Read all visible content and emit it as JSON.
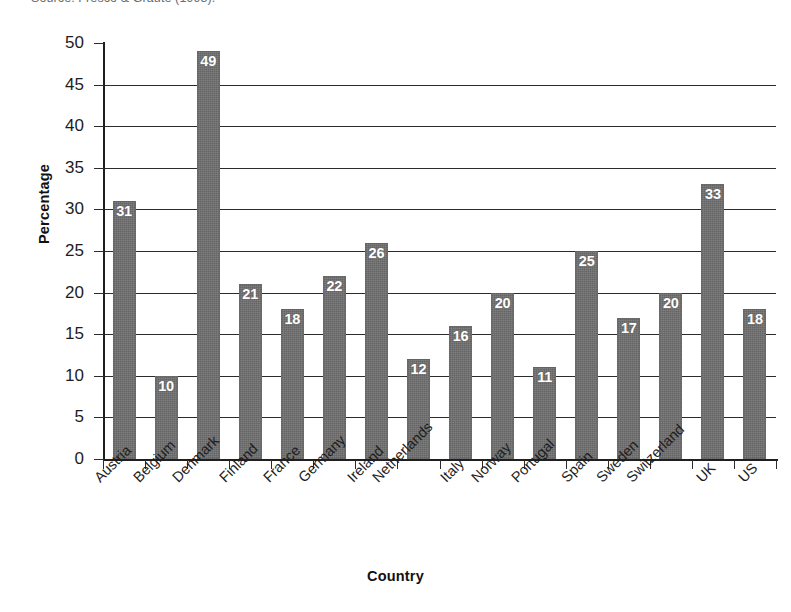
{
  "source_note": "Source: Fresco & Graute (1998).",
  "chart_data": {
    "type": "bar",
    "title": "",
    "xlabel": "Country",
    "ylabel": "Percentage",
    "ylim": [
      0,
      50
    ],
    "ytick_step": 5,
    "yticks": [
      0,
      5,
      10,
      15,
      20,
      25,
      30,
      35,
      40,
      45,
      50
    ],
    "ytick_labels": [
      "0",
      "5",
      "10",
      "15",
      "20",
      "25",
      "30",
      "35",
      "40",
      "45",
      "50"
    ],
    "grid": "horizontal",
    "legend": "none",
    "bar_color": "#6f6f6f",
    "value_label_color": "#ffffff",
    "value_labels_inside_bars": true,
    "xtick_label_rotation": -45,
    "categories": [
      "Austria",
      "Belgium",
      "Denmark",
      "Finland",
      "France",
      "Germany",
      "Ireland",
      "Netherlands",
      "Italy",
      "Norway",
      "Portugal",
      "Spain",
      "Sweden",
      "Switzerland",
      "UK",
      "US"
    ],
    "values": [
      31,
      10,
      49,
      21,
      18,
      22,
      26,
      12,
      16,
      20,
      11,
      25,
      17,
      20,
      33,
      18
    ],
    "value_labels": [
      "31",
      "10",
      "49",
      "21",
      "18",
      "22",
      "26",
      "12",
      "16",
      "20",
      "11",
      "25",
      "17",
      "20",
      "33",
      "18"
    ]
  }
}
